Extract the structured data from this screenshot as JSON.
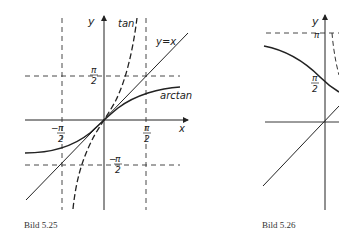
{
  "figures": [
    {
      "caption": "Bild 5.25",
      "labels": {
        "y_axis": "y",
        "x_axis": "x",
        "tan": "tan",
        "identity": "y=x",
        "arctan": "arctan",
        "pi": "π",
        "two": "2",
        "minus": "−"
      }
    },
    {
      "caption": "Bild 5.26",
      "labels": {
        "y_axis": "y",
        "pi": "π",
        "two": "2"
      }
    }
  ],
  "colors": {
    "ink": "#222222",
    "background": "#ffffff"
  }
}
